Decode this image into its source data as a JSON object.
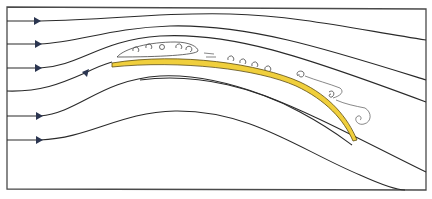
{
  "diagram": {
    "type": "flow-visualization",
    "colors": {
      "frame": "#4a4a4a",
      "streamline": "#2a2a2a",
      "arrow": "#2b3550",
      "wing": "#f0cf3c",
      "background": "#ffffff"
    },
    "streamlines": [
      {
        "id": 1,
        "start_y": 21,
        "has_arrow": true
      },
      {
        "id": 2,
        "start_y": 44,
        "has_arrow": true
      },
      {
        "id": 3,
        "start_y": 68,
        "has_arrow": true
      },
      {
        "id": 4,
        "start_y": 91,
        "has_arrow": true
      },
      {
        "id": 5,
        "start_y": 116,
        "has_arrow": true
      },
      {
        "id": 6,
        "start_y": 140,
        "has_arrow": true
      }
    ],
    "features": [
      "separation bubble above leading portion of wing",
      "small vortices along upper surface",
      "turbulent wake eddies behind trailing edge"
    ]
  }
}
